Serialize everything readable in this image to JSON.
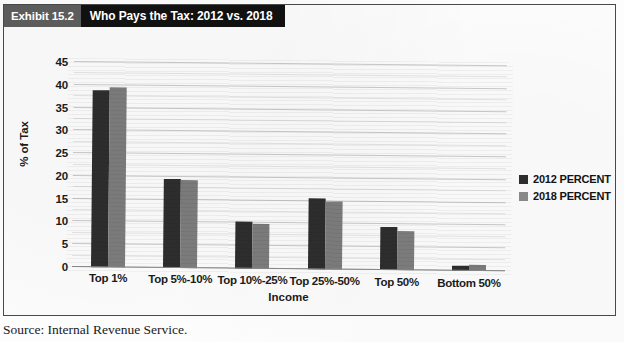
{
  "exhibit": {
    "number": "Exhibit 15.2",
    "title": "Who Pays the Tax: 2012 vs. 2018"
  },
  "source": {
    "caption": "Source: Internal Revenue Service."
  },
  "legend": {
    "items": [
      {
        "label": "2012 PERCENT",
        "color": "#2e2e2e"
      },
      {
        "label": "2018 PERCENT",
        "color": "#8a8a8a"
      }
    ]
  },
  "colors": {
    "series_2012": "#2e2e2e",
    "series_2018": "#7d7d7d",
    "banner_number_bg": "#5c5c5c",
    "banner_title_bg": "#111111",
    "frame": "#4a4a4a"
  },
  "chart_data": {
    "type": "bar",
    "title": "Who Pays the Tax: 2012 vs. 2018",
    "xlabel": "Income",
    "ylabel": "% of Tax",
    "ylim": [
      0,
      45
    ],
    "ytick_step": 5,
    "yticks": [
      "0",
      "5",
      "10",
      "15",
      "20",
      "25",
      "30",
      "35",
      "40",
      "45"
    ],
    "grid": true,
    "legend_position": "right",
    "categories": [
      "Top 1%",
      "Top 5%-10%",
      "Top 10%-25%",
      "Top 25%-50%",
      "Top 50%",
      "Bottom 50%"
    ],
    "series": [
      {
        "name": "2012 PERCENT",
        "color": "#2e2e2e",
        "values": [
          38.8,
          19.5,
          10.4,
          15.5,
          9.4,
          1.0
        ]
      },
      {
        "name": "2018 PERCENT",
        "color": "#7d7d7d",
        "values": [
          39.6,
          19.4,
          9.9,
          15.0,
          8.6,
          1.3
        ]
      }
    ]
  }
}
